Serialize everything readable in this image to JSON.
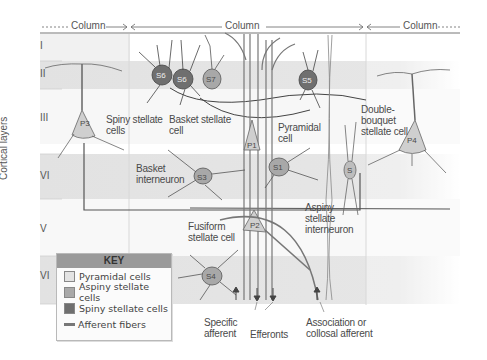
{
  "diagram": {
    "axis_label": "Cortical layers",
    "layers": [
      "I",
      "II",
      "III",
      "VI",
      "V",
      "VI"
    ],
    "columns": [
      "Column",
      "Column",
      "Column"
    ],
    "cell_labels": {
      "spiny_stellate": "Spiny stellate cells",
      "spiny_stellate_l1": "Spiny stellate",
      "spiny_stellate_l2": "cells",
      "basket_stellate_l1": "Basket stellate",
      "basket_stellate_l2": "cell",
      "pyramidal_l1": "Pyramidal",
      "pyramidal_l2": "cell",
      "double_bouquet_l1": "Double-",
      "double_bouquet_l2": "bouquet",
      "double_bouquet_l3": "stellate cell",
      "basket_interneuron_l1": "Basket",
      "basket_interneuron_l2": "interneuron",
      "aspiny_l1": "Aspiny",
      "aspiny_l2": "stellate",
      "aspiny_l3": "interneuron",
      "fusiform_l1": "Fusiform",
      "fusiform_l2": "stellate cell",
      "specific_afferent_l1": "Specific",
      "specific_afferent_l2": "afferent",
      "efferents": "Efferonts",
      "association_l1": "Association or",
      "association_l2": "collosal afferent"
    },
    "soma_labels": {
      "P1": "P1",
      "P2": "P2",
      "P3": "P3",
      "P4": "P4",
      "S1": "S1",
      "S2": "S",
      "S3": "S3",
      "S4": "S4",
      "S5": "S5",
      "S6": "S6",
      "S7": "S7"
    },
    "key": {
      "title": "KEY",
      "items": [
        {
          "label": "Pyramidal cells",
          "color": "#d6d6d6"
        },
        {
          "label": "Aspiny stellate cells",
          "color": "#a9a9a9"
        },
        {
          "label": "Spiny stellate cells",
          "color": "#777777"
        },
        {
          "label": "Afferent fibers",
          "color": "#777777"
        }
      ]
    },
    "colors": {
      "band": "#e4e4e4",
      "pyramidal": "#cfcfcf",
      "aspiny": "#a8a8a8",
      "spiny": "#6f6f6f",
      "line": "#555555"
    }
  }
}
